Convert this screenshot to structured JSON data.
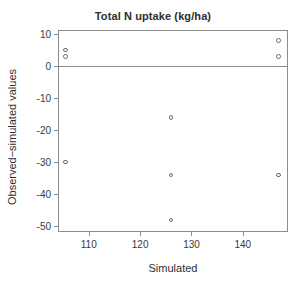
{
  "chart_data": {
    "type": "scatter",
    "title": "Total N uptake (kg/ha)",
    "xlabel": "Simulated",
    "ylabel": "Observed−simulated values",
    "xlim": [
      104.2,
      148.6
    ],
    "ylim": [
      -51.5,
      11.0
    ],
    "xticks": [
      110,
      120,
      130,
      140
    ],
    "xtick_labels": [
      "110",
      "120",
      "130",
      "140"
    ],
    "yticks": [
      10,
      0,
      -10,
      -20,
      -30,
      -40,
      -50
    ],
    "ytick_labels": [
      "10",
      "0",
      "-10",
      "-20",
      "-30",
      "-40",
      "-50"
    ],
    "grid": false,
    "legend": false,
    "reference_lines": [
      {
        "name": "zero-line",
        "orientation": "horizontal",
        "y": 0,
        "color": "#8c8c8c"
      }
    ],
    "marker": {
      "shape": "open-circle",
      "color": "#6e6e6e",
      "size": 4.6
    },
    "x": [
      105.5,
      105.5,
      105.5,
      126.0,
      126.0,
      126.0,
      147.0,
      147.0,
      147.0
    ],
    "y": [
      5,
      3,
      -30,
      -16,
      -34,
      -48,
      8,
      3,
      -34
    ],
    "points": [
      {
        "x": 105.5,
        "y": 5
      },
      {
        "x": 105.5,
        "y": 3
      },
      {
        "x": 105.5,
        "y": -30
      },
      {
        "x": 126.0,
        "y": -16
      },
      {
        "x": 126.0,
        "y": -34
      },
      {
        "x": 126.0,
        "y": -48
      },
      {
        "x": 147.0,
        "y": 8
      },
      {
        "x": 147.0,
        "y": 3
      },
      {
        "x": 147.0,
        "y": -34
      }
    ]
  }
}
